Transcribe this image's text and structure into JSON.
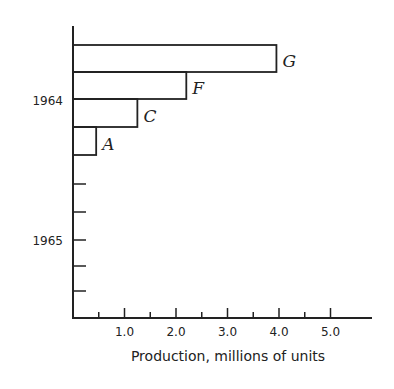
{
  "chart_data": {
    "type": "bar",
    "orientation": "horizontal",
    "title": "",
    "xlabel": "Production, millions of units",
    "ylabel": "",
    "xlim": [
      0,
      5.7
    ],
    "x_ticks": [
      "1.0",
      "2.0",
      "3.0",
      "4.0",
      "5.0"
    ],
    "y_tick_labels": [
      "1964",
      "1965"
    ],
    "grid": false,
    "legend": null,
    "categories": [
      "G",
      "F",
      "C",
      "A"
    ],
    "values": [
      3.95,
      2.2,
      1.25,
      0.45
    ]
  }
}
